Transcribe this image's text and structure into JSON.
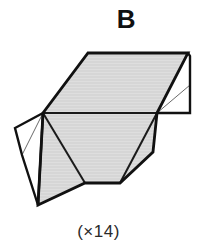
{
  "panel": {
    "label": "B",
    "caption": "(×14)"
  },
  "colors": {
    "background": "#ffffff",
    "face_fill_gray": "#d6d6d6",
    "face_fill_white": "#ffffff",
    "outline": "#111111",
    "crease_thin": "#555555",
    "label_color": "#111111",
    "caption_color": "#2a2a2a"
  },
  "figure": {
    "kind": "origami-crease-net",
    "width": 201,
    "height": 248,
    "vertices": {
      "top_left": [
        88,
        53
      ],
      "top_right": [
        188,
        53
      ],
      "mid_left": [
        43,
        113
      ],
      "mid_right": [
        157,
        113
      ],
      "right_flap_outer_top": [
        190,
        55
      ],
      "right_flap_outer_bottom": [
        190,
        113
      ],
      "right_flap_crease_end": [
        190,
        85
      ],
      "left_flap_outer_left": [
        15,
        128
      ],
      "left_flap_outer_bottom": [
        22,
        155
      ],
      "bottom_apex": [
        38,
        205
      ],
      "bottom_notch_left": [
        85,
        183
      ],
      "bottom_notch_right": [
        120,
        183
      ],
      "lower_right_corner": [
        153,
        152
      ]
    },
    "faces": [
      {
        "name": "upper-main-face",
        "fill": "gray",
        "points": "88,53 188,53 157,113 43,113"
      },
      {
        "name": "right-flap-face",
        "fill": "white",
        "points": "188,53 190,55 190,113 157,113"
      },
      {
        "name": "left-flap-face",
        "fill": "white",
        "points": "43,113 15,128 22,155 40,168"
      },
      {
        "name": "lower-left-triangle",
        "fill": "gray",
        "points": "43,113 38,205 85,183"
      },
      {
        "name": "lower-center-face",
        "fill": "gray",
        "points": "43,113 85,183 120,183 157,113"
      },
      {
        "name": "lower-right-triangle",
        "fill": "gray",
        "points": "120,183 153,152 157,113"
      }
    ],
    "creases": [
      {
        "name": "mid-horizontal-crease",
        "weight": "medium",
        "from": [
          43,
          113
        ],
        "to": [
          157,
          113
        ]
      },
      {
        "name": "left-flap-thin-crease",
        "weight": "thin",
        "from": [
          43,
          113
        ],
        "to": [
          22,
          155
        ]
      },
      {
        "name": "right-flap-thin-crease",
        "weight": "thin",
        "from": [
          157,
          113
        ],
        "to": [
          190,
          85
        ]
      },
      {
        "name": "lower-left-crease",
        "weight": "medium",
        "from": [
          43,
          113
        ],
        "to": [
          38,
          205
        ]
      },
      {
        "name": "lower-center-crease",
        "weight": "medium",
        "from": [
          43,
          113
        ],
        "to": [
          85,
          183
        ]
      },
      {
        "name": "lower-right-crease",
        "weight": "medium",
        "from": [
          120,
          183
        ],
        "to": [
          157,
          113
        ]
      }
    ],
    "outline_path": "M 88,53 L 188,53 L 190,55 L 190,113 L 157,113 L 153,152 L 120,183 L 85,183 L 38,205 L 22,155 L 15,128 L 43,113 Z"
  }
}
